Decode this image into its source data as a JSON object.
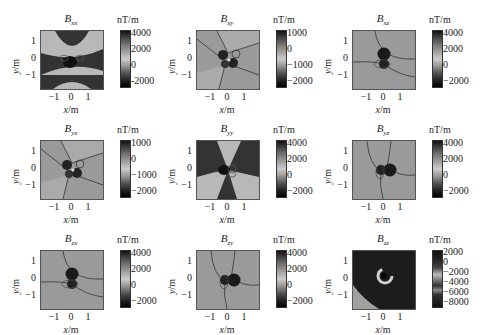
{
  "chart_data": [
    {
      "type": "heatmap",
      "title": "Bxx",
      "unit": "nT/m",
      "xlabel": "x/m",
      "ylabel": "y/m",
      "xticks": [
        "-1",
        "0",
        "1"
      ],
      "yticks": [
        "1",
        "0",
        "-1"
      ],
      "colorbar_ticks": [
        "4000",
        "2000",
        "0",
        "-2000"
      ],
      "colorbar_range": [
        -2500,
        4500
      ],
      "pattern": "quadrupole with dark top/bottom wedges, light left/right wedges, dark anomaly at center"
    },
    {
      "type": "heatmap",
      "title": "Bxy",
      "unit": "nT/m",
      "xlabel": "x/m",
      "ylabel": "y/m",
      "xticks": [
        "-1",
        "0",
        "1"
      ],
      "yticks": [
        "1",
        "0",
        "-1"
      ],
      "colorbar_ticks": [
        "1000",
        "0",
        "-1000",
        "-2000"
      ],
      "colorbar_range": [
        -2300,
        1500
      ],
      "pattern": "light background split into four sectors by contour lines, clover-shaped dark anomaly at center"
    },
    {
      "type": "heatmap",
      "title": "Bxz",
      "unit": "nT/m",
      "xlabel": "x/m",
      "ylabel": "y/m",
      "xticks": [
        "-1",
        "0",
        "1"
      ],
      "yticks": [
        "1",
        "0",
        "-1"
      ],
      "colorbar_ticks": [
        "4000",
        "2000",
        "0",
        "-2000"
      ],
      "colorbar_range": [
        -2800,
        4800
      ],
      "pattern": "light background, dark dipole anomaly vertically elongated at center"
    },
    {
      "type": "heatmap",
      "title": "Byx",
      "unit": "nT/m",
      "xlabel": "x/m",
      "ylabel": "y/m",
      "xticks": [
        "-1",
        "0",
        "1"
      ],
      "yticks": [
        "1",
        "0",
        "-1"
      ],
      "colorbar_ticks": [
        "1000",
        "0",
        "-1000",
        "-2000"
      ],
      "colorbar_range": [
        -2300,
        1500
      ],
      "pattern": "light background split into four sectors, clover-shaped dark anomaly at center"
    },
    {
      "type": "heatmap",
      "title": "Byy",
      "unit": "nT/m",
      "xlabel": "x/m",
      "ylabel": "y/m",
      "xticks": [
        "-1",
        "0",
        "1"
      ],
      "yticks": [
        "1",
        "0",
        "-1"
      ],
      "colorbar_ticks": [
        "4000",
        "2000",
        "0",
        "-2000"
      ],
      "colorbar_range": [
        -2500,
        4500
      ],
      "pattern": "quadrupole with dark left/right wedges, light top/bottom wedges"
    },
    {
      "type": "heatmap",
      "title": "Byz",
      "unit": "nT/m",
      "xlabel": "x/m",
      "ylabel": "y/m",
      "xticks": [
        "-1",
        "0",
        "1"
      ],
      "yticks": [
        "1",
        "0",
        "-1"
      ],
      "colorbar_ticks": [
        "4000",
        "2000",
        "0",
        "-2000"
      ],
      "colorbar_range": [
        -2800,
        4800
      ],
      "pattern": "light background, dark dipole anomaly horizontally elongated at center"
    },
    {
      "type": "heatmap",
      "title": "Bzx",
      "unit": "nT/m",
      "xlabel": "x/m",
      "ylabel": "y/m",
      "xticks": [
        "-1",
        "0",
        "1"
      ],
      "yticks": [
        "1",
        "0",
        "-1"
      ],
      "colorbar_ticks": [
        "4000",
        "2000",
        "0",
        "-2000"
      ],
      "colorbar_range": [
        -2800,
        4800
      ],
      "pattern": "light background, dark dipole anomaly vertically elongated at center"
    },
    {
      "type": "heatmap",
      "title": "Bzy",
      "unit": "nT/m",
      "xlabel": "x/m",
      "ylabel": "y/m",
      "xticks": [
        "-1",
        "0",
        "1"
      ],
      "yticks": [
        "1",
        "0",
        "-1"
      ],
      "colorbar_ticks": [
        "4000",
        "2000",
        "0",
        "-2000"
      ],
      "colorbar_range": [
        -2800,
        4800
      ],
      "pattern": "light background, dark dipole anomaly horizontally elongated at center"
    },
    {
      "type": "heatmap",
      "title": "Bzz",
      "unit": "nT/m",
      "xlabel": "x/m",
      "ylabel": "y/m",
      "xticks": [
        "-1",
        "0",
        "1"
      ],
      "yticks": [
        "1",
        "0",
        "-1"
      ],
      "colorbar_ticks": [
        "2000",
        "0",
        "-2000",
        "-4000",
        "-6000",
        "-8000"
      ],
      "colorbar_range": [
        -9000,
        2500
      ],
      "pattern": "dark background, light ring anomaly at center, light triangle in lower-left corner"
    }
  ],
  "panels": [
    {
      "t": "B",
      "s": "xx",
      "unit": "nT/m",
      "ticks": [
        "4000",
        "2000",
        "0",
        "-2000"
      ]
    },
    {
      "t": "B",
      "s": "xy",
      "unit": "nT/m",
      "ticks": [
        "1000",
        "0",
        "−1000",
        "−2000"
      ]
    },
    {
      "t": "B",
      "s": "xz",
      "unit": "nT/m",
      "ticks": [
        "4000",
        "2000",
        "0",
        "−2000"
      ]
    },
    {
      "t": "B",
      "s": "yx",
      "unit": "nT/m",
      "ticks": [
        "1000",
        "0",
        "−1000",
        "−2000"
      ]
    },
    {
      "t": "B",
      "s": "yy",
      "unit": "nT/m",
      "ticks": [
        "4000",
        "2000",
        "0",
        "−2000"
      ]
    },
    {
      "t": "B",
      "s": "yz",
      "unit": "nT/m",
      "ticks": [
        "4000",
        "2000",
        "0",
        "−2000"
      ]
    },
    {
      "t": "B",
      "s": "zx",
      "unit": "nT/m",
      "ticks": [
        "4000",
        "2000",
        "0",
        "−2000"
      ]
    },
    {
      "t": "B",
      "s": "zy",
      "unit": "nT/m",
      "ticks": [
        "4000",
        "2000",
        "0",
        "−2000"
      ]
    },
    {
      "t": "B",
      "s": "zz",
      "unit": "nT/m",
      "ticks": [
        "2000",
        "0",
        "−2000",
        "−4000",
        "−6000",
        "−8000"
      ]
    }
  ],
  "axes": {
    "xlabel_var": "x",
    "ylabel_var": "y",
    "unit": "/m",
    "xticks": [
      "−1",
      "0",
      "1"
    ],
    "yticks": [
      "1",
      "0",
      "−1"
    ]
  }
}
